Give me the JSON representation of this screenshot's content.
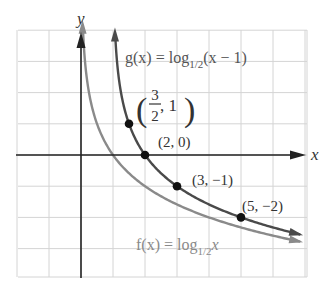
{
  "chart_data": {
    "type": "line",
    "title": "",
    "xlabel": "x",
    "ylabel": "y",
    "xlim": [
      -2,
      7
    ],
    "ylim": [
      -4,
      4
    ],
    "grid": true,
    "series": [
      {
        "name": "g(x) = log_1/2(x − 1)",
        "label_main": "g(x) = log",
        "label_sub": "1/2",
        "label_tail": "(x − 1)",
        "color": "#4a4a4a",
        "shift": 1,
        "points": [
          {
            "x": 1.5,
            "y": 1,
            "label_frac_num": "3",
            "label_frac_den": "2",
            "label_rest": ", 1"
          },
          {
            "x": 2,
            "y": 0,
            "label": "(2, 0)"
          },
          {
            "x": 3,
            "y": -1,
            "label": "(3, −1)"
          },
          {
            "x": 5,
            "y": -2,
            "label": "(5, −2)"
          }
        ]
      },
      {
        "name": "f(x) = log_1/2 x",
        "label_main": "f(x) = log",
        "label_sub": "1/2",
        "label_tail": "x",
        "color": "#8a8a8a",
        "shift": 0,
        "points": []
      }
    ]
  },
  "colors": {
    "grid": "#d4d4d4",
    "axis": "#222222",
    "point": "#111111",
    "text": "#333333",
    "f_label": "#8a8a8a"
  }
}
